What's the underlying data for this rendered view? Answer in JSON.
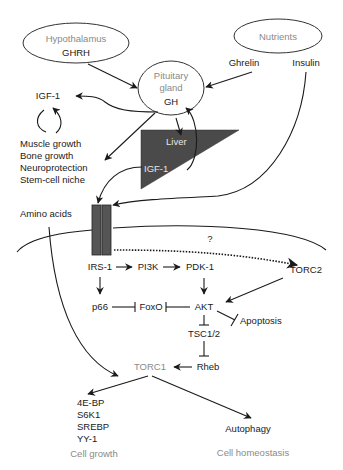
{
  "diagram": {
    "nodes": {
      "hypothalamus": {
        "title": "Hypothalamus",
        "sub": "GHRH"
      },
      "nutrients": {
        "title": "Nutrients"
      },
      "ghrelin": "Ghrelin",
      "insulin": "Insulin",
      "pituitary": {
        "line1": "Pituitary",
        "line2": "gland",
        "sub": "GH"
      },
      "igf1_top": "IGF-1",
      "effects": [
        "Muscle growth",
        "Bone growth",
        "Neuroprotection",
        "Stem-cell niche"
      ],
      "liver": {
        "title": "Liver",
        "sub": "IGF-1"
      },
      "amino_acids": "Amino acids",
      "question": "?",
      "irs1": "IRS-1",
      "pi3k": "PI3K",
      "pdk1": "PDK-1",
      "torc2": "TORC2",
      "p66": "p66",
      "foxo": "FoxO",
      "akt": "AKT",
      "apoptosis": "Apoptosis",
      "tsc": "TSC1/2",
      "rheb": "Rheb",
      "torc1": "TORC1",
      "targets": [
        "4E-BP",
        "S6K1",
        "SREBP",
        "YY-1"
      ],
      "autophagy": "Autophagy",
      "cell_growth": "Cell growth",
      "cell_homeostasis": "Cell homeostasis"
    },
    "colors": {
      "liver_fill": "#4a4a4a",
      "receptor_fill": "#555555",
      "line": "#1a1a1a",
      "gray_text": "#8a8a8a"
    }
  }
}
